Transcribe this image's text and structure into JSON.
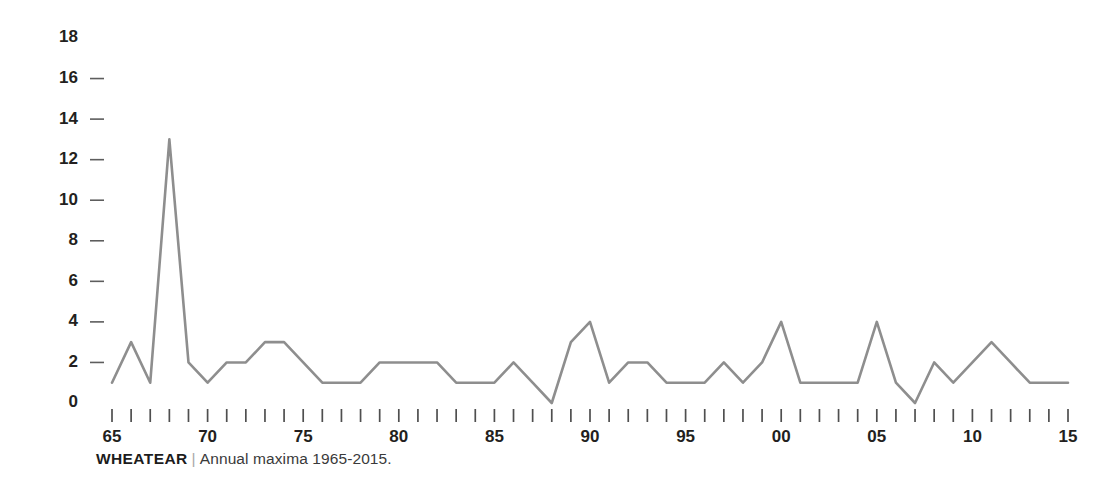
{
  "caption": {
    "title": "WHEATEAR",
    "separator": "|",
    "description": "Annual maxima 1965-2015."
  },
  "chart_data": {
    "type": "line",
    "title": "",
    "subtitle": "",
    "xlabel": "",
    "ylabel": "",
    "grid": false,
    "legend": "none",
    "line_color": "#8e8e8e",
    "xlim": [
      1965,
      2015
    ],
    "ylim": [
      0,
      18
    ],
    "ytick_values": [
      0,
      2,
      4,
      6,
      8,
      10,
      12,
      14,
      16,
      18
    ],
    "ytick_labels": [
      "0",
      "2",
      "4",
      "6",
      "8",
      "10",
      "12",
      "14",
      "16",
      "18"
    ],
    "ytick_dash_values": [
      2,
      4,
      6,
      8,
      10,
      12,
      14,
      16
    ],
    "xtick_values": [
      1965,
      1966,
      1967,
      1968,
      1969,
      1970,
      1971,
      1972,
      1973,
      1974,
      1975,
      1976,
      1977,
      1978,
      1979,
      1980,
      1981,
      1982,
      1983,
      1984,
      1985,
      1986,
      1987,
      1988,
      1989,
      1990,
      1991,
      1992,
      1993,
      1994,
      1995,
      1996,
      1997,
      1998,
      1999,
      2000,
      2001,
      2002,
      2003,
      2004,
      2005,
      2006,
      2007,
      2008,
      2009,
      2010,
      2011,
      2012,
      2013,
      2014,
      2015
    ],
    "xtick_labeled": [
      {
        "value": 1965,
        "label": "65"
      },
      {
        "value": 1970,
        "label": "70"
      },
      {
        "value": 1975,
        "label": "75"
      },
      {
        "value": 1980,
        "label": "80"
      },
      {
        "value": 1985,
        "label": "85"
      },
      {
        "value": 1990,
        "label": "90"
      },
      {
        "value": 1995,
        "label": "95"
      },
      {
        "value": 2000,
        "label": "00"
      },
      {
        "value": 2005,
        "label": "05"
      },
      {
        "value": 2010,
        "label": "10"
      },
      {
        "value": 2015,
        "label": "15"
      }
    ],
    "x": [
      1965,
      1966,
      1967,
      1968,
      1969,
      1970,
      1971,
      1972,
      1973,
      1974,
      1975,
      1976,
      1977,
      1978,
      1979,
      1980,
      1981,
      1982,
      1983,
      1984,
      1985,
      1986,
      1987,
      1988,
      1989,
      1990,
      1991,
      1992,
      1993,
      1994,
      1995,
      1996,
      1997,
      1998,
      1999,
      2000,
      2001,
      2002,
      2003,
      2004,
      2005,
      2006,
      2007,
      2008,
      2009,
      2010,
      2011,
      2012,
      2013,
      2014,
      2015
    ],
    "values": [
      1,
      3,
      1,
      13,
      2,
      1,
      2,
      2,
      3,
      3,
      2,
      1,
      1,
      1,
      2,
      2,
      2,
      2,
      1,
      1,
      1,
      2,
      1,
      0,
      3,
      4,
      1,
      2,
      2,
      1,
      1,
      1,
      2,
      1,
      2,
      4,
      1,
      1,
      1,
      1,
      4,
      1,
      0,
      2,
      1,
      2,
      3,
      2,
      1,
      1,
      1
    ]
  }
}
